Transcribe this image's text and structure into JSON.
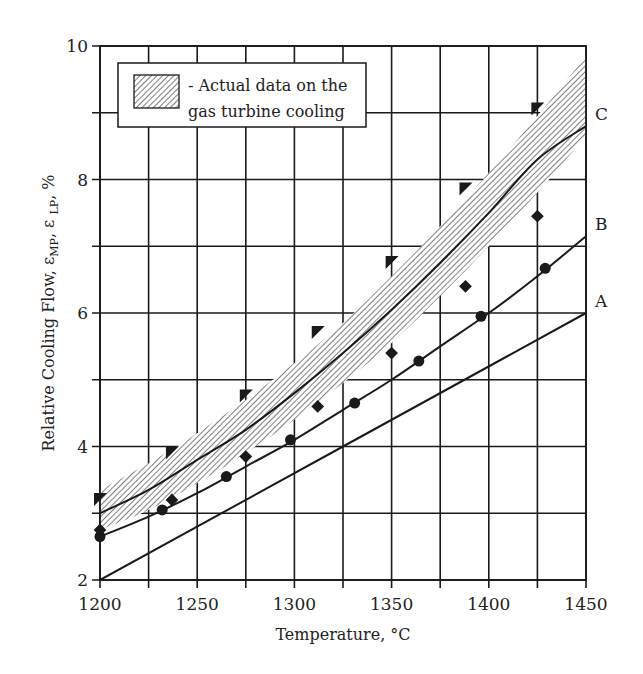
{
  "chart_data": {
    "type": "line",
    "title": "",
    "xlabel": "Temperature, °C",
    "ylabel": "Relative Cooling Flow, ε_MP, ε_LP, %",
    "ylabel_parts": {
      "main": "Relative Cooling Flow, ε",
      "sub1": "MP",
      "mid": ", ε ",
      "sub2": "LP",
      "end": ", %"
    },
    "xlim": [
      1200,
      1450
    ],
    "ylim": [
      2,
      10
    ],
    "x_ticks": [
      1200,
      1250,
      1300,
      1350,
      1400,
      1450
    ],
    "x_minor_ticks": [
      1225,
      1275,
      1325,
      1375,
      1425
    ],
    "y_ticks": [
      2,
      4,
      6,
      8,
      10
    ],
    "y_minor_ticks": [
      3,
      5,
      7,
      9
    ],
    "grid": true,
    "legend": {
      "position": "upper-left",
      "entries": [
        {
          "swatch": "hatched",
          "line1": "- Actual data on the",
          "line2": "gas turbine cooling"
        }
      ]
    },
    "band": {
      "name": "Actual data on the gas turbine cooling",
      "x": [
        1200,
        1225,
        1250,
        1275,
        1300,
        1325,
        1350,
        1375,
        1400,
        1425,
        1450
      ],
      "upper": [
        3.35,
        3.75,
        4.2,
        4.7,
        5.25,
        5.85,
        6.55,
        7.3,
        8.1,
        8.95,
        9.85
      ],
      "lower": [
        2.75,
        3.05,
        3.45,
        3.9,
        4.4,
        4.95,
        5.55,
        6.25,
        7.0,
        7.8,
        8.65
      ]
    },
    "series": [
      {
        "name": "A",
        "style": "line",
        "x": [
          1200,
          1450
        ],
        "y": [
          2.0,
          6.0
        ]
      },
      {
        "name": "B",
        "style": "line-circles",
        "x": [
          1200,
          1225,
          1250,
          1275,
          1300,
          1325,
          1350,
          1375,
          1400,
          1425,
          1450
        ],
        "y": [
          2.65,
          2.95,
          3.3,
          3.7,
          4.1,
          4.55,
          5.0,
          5.5,
          6.0,
          6.55,
          7.15
        ]
      },
      {
        "name": "C",
        "style": "line",
        "x": [
          1200,
          1225,
          1250,
          1275,
          1300,
          1325,
          1350,
          1375,
          1400,
          1425,
          1450
        ],
        "y": [
          3.0,
          3.35,
          3.8,
          4.25,
          4.8,
          5.4,
          6.05,
          6.75,
          7.5,
          8.3,
          8.8
        ]
      },
      {
        "name": "B markers (circles)",
        "style": "markers-circle",
        "x": [
          1200,
          1232,
          1265,
          1298,
          1331,
          1364,
          1396,
          1429
        ],
        "y": [
          2.65,
          3.05,
          3.55,
          4.1,
          4.65,
          5.28,
          5.95,
          6.67
        ]
      },
      {
        "name": "Upper data (squares)",
        "style": "markers-square",
        "x": [
          1200,
          1237,
          1275,
          1312,
          1350,
          1388,
          1425
        ],
        "y": [
          3.2,
          3.9,
          4.75,
          5.7,
          6.75,
          7.85,
          9.05
        ]
      },
      {
        "name": "Lower data (diamonds)",
        "style": "markers-diamond",
        "x": [
          1200,
          1237,
          1275,
          1312,
          1350,
          1388,
          1425
        ],
        "y": [
          2.75,
          3.2,
          3.85,
          4.6,
          5.4,
          6.4,
          7.45
        ]
      }
    ],
    "curve_labels": [
      {
        "text": "A",
        "x": 1450,
        "y": 6.0
      },
      {
        "text": "B",
        "x": 1450,
        "y": 7.15
      },
      {
        "text": "C",
        "x": 1450,
        "y": 8.8
      }
    ]
  },
  "colors": {
    "ink": "#1a1a1a",
    "hatch": "#8a8a8a",
    "background": "#ffffff"
  }
}
